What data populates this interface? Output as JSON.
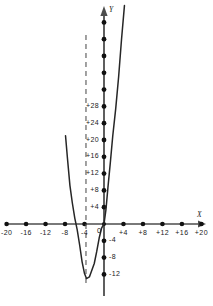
{
  "chart_data": {
    "type": "line",
    "title": "",
    "subtitle": "",
    "xlabel": "X",
    "ylabel": "Y",
    "xlim": [
      -22,
      22
    ],
    "ylim": [
      -14,
      34
    ],
    "grid": false,
    "legend": null,
    "x_ticks": [
      -20,
      -16,
      -12,
      -8,
      -4,
      0,
      4,
      8,
      12,
      16,
      20
    ],
    "x_tick_labels": [
      "-20",
      "-16",
      "-12",
      "-8",
      "-4",
      "0",
      "+4",
      "+8",
      "+12",
      "+16",
      "+20"
    ],
    "y_ticks": [
      -12,
      -8,
      -4,
      4,
      8,
      12,
      16,
      20,
      24,
      28
    ],
    "y_tick_labels": [
      "-12",
      "-8",
      "-4",
      "+4",
      "+8",
      "+12",
      "+16",
      "+20",
      "+24",
      "+28"
    ],
    "y_unlabeled_ticks": [
      32,
      36,
      40,
      44,
      48
    ],
    "origin_label": "0",
    "series": [
      {
        "name": "parabola",
        "type": "curve",
        "vertex": [
          -3.6,
          -13.0
        ],
        "leading_coefficient": 1.0,
        "roots": [
          -7.2,
          0.0
        ],
        "points": [
          [
            -7.9,
            21.0
          ],
          [
            -7.5,
            15.6
          ],
          [
            -7.0,
            9.2
          ],
          [
            -6.5,
            5.0
          ],
          [
            -6.0,
            1.4
          ],
          [
            -5.5,
            -1.4
          ],
          [
            -5.0,
            -5.0
          ],
          [
            -4.5,
            -9.0
          ],
          [
            -4.0,
            -11.8
          ],
          [
            -3.6,
            -13.0
          ],
          [
            -3.0,
            -12.6
          ],
          [
            -2.5,
            -11.0
          ],
          [
            -2.0,
            -9.4
          ],
          [
            -1.5,
            -6.6
          ],
          [
            -1.0,
            -3.4
          ],
          [
            -0.5,
            -1.0
          ],
          [
            0.0,
            0.0
          ],
          [
            0.4,
            3.4
          ],
          [
            0.8,
            8.6
          ],
          [
            1.3,
            14.6
          ],
          [
            1.8,
            21.0
          ],
          [
            2.4,
            27.4
          ],
          [
            3.0,
            35.0
          ],
          [
            3.6,
            44.0
          ],
          [
            4.2,
            52.0
          ]
        ]
      }
    ],
    "annotations": [
      {
        "name": "axis-of-symmetry",
        "style": "dashed-vertical-line",
        "x": -3.7,
        "y_from": -14.5,
        "y_to": 45.0
      }
    ],
    "colors": {
      "curve": "#262626",
      "axis": "#4d4d4d",
      "tick_dot": "#111111",
      "dashed_line": "#555555",
      "text": "#1a1a1a",
      "background": "#ffffff"
    }
  }
}
